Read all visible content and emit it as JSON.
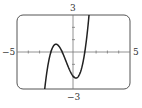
{
  "chart_data": {
    "type": "line",
    "title": "",
    "xlabel": "",
    "ylabel": "",
    "xlim": [
      -5,
      5
    ],
    "ylim": [
      -3,
      3
    ],
    "grid": false,
    "legend": null,
    "tick_labels": {
      "x_min": "−5",
      "x_max": "5",
      "y_max": "3",
      "y_min": "−3"
    },
    "x_ticks": [
      -4,
      -3,
      -2,
      -1,
      1,
      2,
      3,
      4
    ],
    "y_ticks": [
      -2,
      -1,
      1,
      2
    ],
    "series": [
      {
        "name": "cubic",
        "expression": "y = x^3 + 2x^2 - x - 2",
        "x": [
          -2.6,
          -2.4,
          -2.2,
          -2.0,
          -1.8,
          -1.55,
          -1.3,
          -1.0,
          -0.8,
          -0.6,
          -0.4,
          -0.2,
          0.0,
          0.22,
          0.4,
          0.6,
          0.8,
          1.0,
          1.2,
          1.35
        ],
        "values": [
          -2.38,
          -1.18,
          -0.41,
          0.0,
          0.18,
          0.63,
          0.48,
          0.0,
          -0.43,
          -0.94,
          -1.38,
          -1.73,
          -2.0,
          -2.11,
          -1.98,
          -1.62,
          -1.0,
          0.0,
          1.41,
          3.0
        ]
      }
    ],
    "line_color": "#222222",
    "frame_color": "#555555"
  }
}
